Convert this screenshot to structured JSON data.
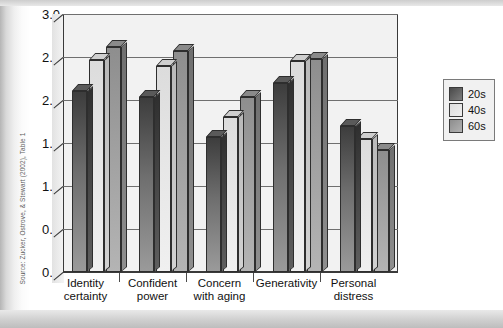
{
  "source_note": "Source: Zucker, Ostrove, & Stewart (2002), Table 1",
  "legend": {
    "items": [
      {
        "label": "20s",
        "swatch": "swatch-dark-gray",
        "color": "#5f5f5f"
      },
      {
        "label": "40s",
        "swatch": "swatch-light-gray",
        "color": "#e4e4e4"
      },
      {
        "label": "60s",
        "swatch": "swatch-medium-gray",
        "color": "#a0a0a0"
      }
    ]
  },
  "yaxis": {
    "ticks": [
      "3.0",
      "2.5",
      "2.0",
      "1.5",
      "1.0",
      "0.5",
      "0.0"
    ]
  },
  "chart_data": {
    "type": "bar",
    "title": "",
    "xlabel": "",
    "ylabel": "",
    "ylim": [
      0.0,
      3.0
    ],
    "ytick_step": 0.5,
    "grid": true,
    "legend_position": "right",
    "three_d": true,
    "categories": [
      "Identity certainty",
      "Confident power",
      "Concern with aging",
      "Generativity",
      "Personal distress"
    ],
    "category_lines": [
      [
        "Identity",
        "certainty"
      ],
      [
        "Confident",
        "power"
      ],
      [
        "Concern",
        "with aging"
      ],
      [
        "Generativity",
        ""
      ],
      [
        "Personal",
        "distress"
      ]
    ],
    "series": [
      {
        "name": "20s",
        "color": "#5f5f5f",
        "values": [
          2.1,
          2.03,
          1.57,
          2.2,
          1.7
        ]
      },
      {
        "name": "40s",
        "color": "#e4e4e4",
        "values": [
          2.47,
          2.4,
          1.8,
          2.45,
          1.55
        ]
      },
      {
        "name": "60s",
        "color": "#a0a0a0",
        "values": [
          2.62,
          2.57,
          2.03,
          2.48,
          1.42
        ]
      }
    ]
  }
}
